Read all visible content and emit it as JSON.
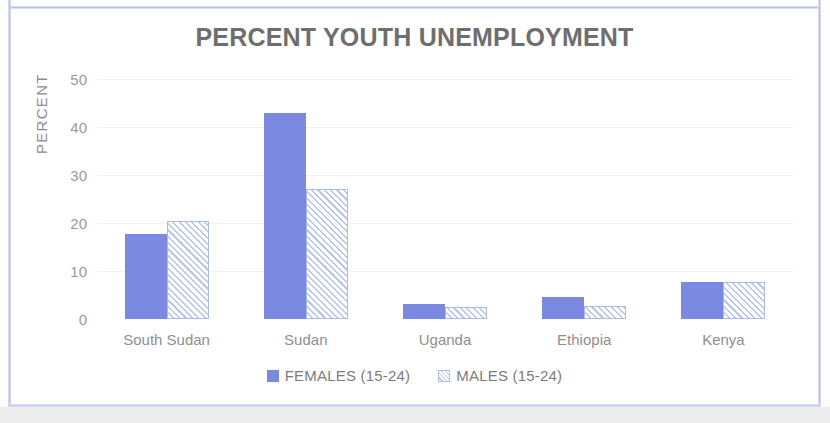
{
  "chart_data": {
    "type": "bar",
    "title": "PERCENT YOUTH UNEMPLOYMENT",
    "xlabel": "",
    "ylabel": "PERCENT",
    "categories": [
      "South Sudan",
      "Sudan",
      "Uganda",
      "Ethiopia",
      "Kenya"
    ],
    "series": [
      {
        "name": "FEMALES (15-24)",
        "color": "#7b8ae0",
        "pattern": "solid",
        "values": [
          17.7,
          43.0,
          3.2,
          4.5,
          7.8
        ]
      },
      {
        "name": "MALES (15-24)",
        "color": "#b9c8ea",
        "pattern": "diagonal-hatch",
        "values": [
          20.5,
          27.0,
          2.5,
          2.8,
          7.8
        ]
      }
    ],
    "ylim": [
      0,
      50
    ],
    "yticks": [
      0,
      10,
      20,
      30,
      40,
      50
    ],
    "ytick_labels": [
      "0",
      "10",
      "20",
      "30",
      "40",
      "50"
    ],
    "grid": true,
    "legend_position": "bottom"
  },
  "colors": {
    "bar_female": "#7b8ae0",
    "bar_male_outline": "#a9bbe6",
    "title_text": "#6e6e6e",
    "axis_text": "#9a9a9a",
    "page_border": "#b9c0e8"
  }
}
